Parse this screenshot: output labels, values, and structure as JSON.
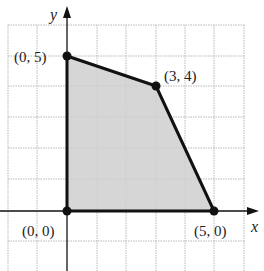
{
  "diagram": {
    "type": "feasible-region-polygon",
    "axes": {
      "x_label": "x",
      "y_label": "y"
    },
    "grid": {
      "x_min": -2,
      "x_max": 6,
      "y_min": -1,
      "y_max": 6,
      "step": 1
    },
    "colors": {
      "region_fill": "#cfcfcf",
      "boundary": "#111111",
      "grid": "#b0b0b0"
    },
    "vertices": [
      {
        "label": "(0, 0)",
        "x": 0,
        "y": 0
      },
      {
        "label": "(0, 5)",
        "x": 0,
        "y": 5
      },
      {
        "label": "(3, 4)",
        "x": 3,
        "y": 4
      },
      {
        "label": "(5, 0)",
        "x": 5,
        "y": 0
      }
    ]
  }
}
